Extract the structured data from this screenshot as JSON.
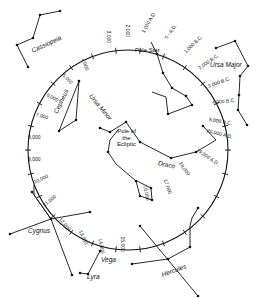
{
  "diagram": {
    "circle": {
      "cx": 128,
      "cy": 150,
      "r": 100
    },
    "center_label": [
      "Pole of",
      "the",
      "Ecliptic"
    ],
    "pole_star_label": "Pole Star",
    "year_ticks": [
      {
        "label": "3,000",
        "x": 108,
        "y": 28,
        "rot": 90
      },
      {
        "label": "2,000",
        "x": 127,
        "y": 22,
        "rot": 90
      },
      {
        "label": "1,000 A.D.",
        "x": 143,
        "y": 30,
        "rot": -60
      },
      {
        "label": "0 - A.D.",
        "x": 166,
        "y": 36,
        "rot": -55
      },
      {
        "label": "1,000 B.C.",
        "x": 185,
        "y": 50,
        "rot": -45
      },
      {
        "label": "2,000 B.C.",
        "x": 199,
        "y": 66,
        "rot": -35
      },
      {
        "label": "3,000 B.C.",
        "x": 208,
        "y": 84,
        "rot": -20
      },
      {
        "label": "4,000 B.C.",
        "x": 212,
        "y": 100,
        "rot": -5
      },
      {
        "label": "5,000 B.C.",
        "x": 209,
        "y": 117,
        "rot": 10
      },
      {
        "label": "20,000 A.D.",
        "x": 207,
        "y": 128,
        "rot": 15
      },
      {
        "label": "19,000 A.D.",
        "x": 197,
        "y": 147,
        "rot": 35
      },
      {
        "label": "18,000",
        "x": 180,
        "y": 160,
        "rot": 55
      },
      {
        "label": "17,000",
        "x": 165,
        "y": 177,
        "rot": 70
      },
      {
        "label": "16,000",
        "x": 145,
        "y": 183,
        "rot": 80
      },
      {
        "label": "15,000",
        "x": 122,
        "y": 234,
        "rot": 90
      },
      {
        "label": "14,000",
        "x": 100,
        "y": 236,
        "rot": 80
      },
      {
        "label": "13,000",
        "x": 80,
        "y": 228,
        "rot": 65
      },
      {
        "label": "12,000",
        "x": 60,
        "y": 216,
        "rot": 50
      },
      {
        "label": "11,000",
        "x": 44,
        "y": 203,
        "rot": -40
      },
      {
        "label": "10,000",
        "x": 34,
        "y": 180,
        "rot": -25
      },
      {
        "label": "9,000",
        "x": 28,
        "y": 157,
        "rot": 0
      },
      {
        "label": "8,000",
        "x": 28,
        "y": 135,
        "rot": 0
      },
      {
        "label": "7,000",
        "x": 36,
        "y": 112,
        "rot": 15
      },
      {
        "label": "6,000",
        "x": 47,
        "y": 92,
        "rot": 30
      },
      {
        "label": "5,000",
        "x": 63,
        "y": 72,
        "rot": 45
      },
      {
        "label": "4,000",
        "x": 83,
        "y": 56,
        "rot": 70
      }
    ],
    "constellations": [
      {
        "name": "Cassiopeia",
        "x": 32,
        "y": 48,
        "rot": -25
      },
      {
        "name": "Cepheus",
        "x": 56,
        "y": 110,
        "rot": -65
      },
      {
        "name": "Ursa Minor",
        "x": 90,
        "y": 92,
        "rot": 50
      },
      {
        "name": "Ursa Major",
        "x": 210,
        "y": 62,
        "rot": 0
      },
      {
        "name": "Draco",
        "x": 158,
        "y": 160,
        "rot": 12
      },
      {
        "name": "Cygnus",
        "x": 28,
        "y": 228,
        "rot": 0
      },
      {
        "name": "Vega",
        "x": 101,
        "y": 257,
        "rot": 0
      },
      {
        "name": "Lyra",
        "x": 87,
        "y": 274,
        "rot": 0
      },
      {
        "name": "Hercules",
        "x": 162,
        "y": 272,
        "rot": -20
      }
    ]
  }
}
